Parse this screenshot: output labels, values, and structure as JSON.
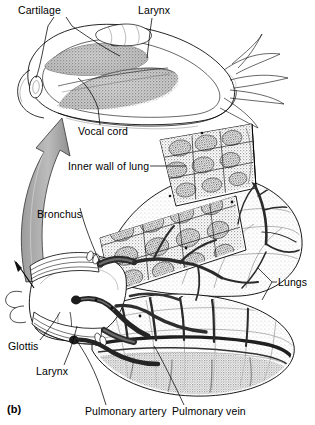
{
  "figure": {
    "panel_id": "(b)",
    "colors": {
      "ink": "#000000",
      "paper": "#ffffff",
      "arrow_fill": "#b0b0b0",
      "tissue_shade": "#8a8a8a",
      "vessel_dark": "#2b2b2b"
    }
  },
  "labels": [
    {
      "id": "cartilage",
      "text": "Cartilage",
      "x": 18,
      "y": 5,
      "leader_to": [
        [
          67,
          17
        ],
        [
          118,
          57
        ]
      ]
    },
    {
      "id": "cartilage-2",
      "text": "",
      "x": 0,
      "y": 0,
      "leader_to": [
        [
          53,
          17
        ],
        [
          36,
          93
        ]
      ]
    },
    {
      "id": "larynx-top",
      "text": "Larynx",
      "x": 138,
      "y": 5,
      "leader_to": [
        [
          150,
          17
        ],
        [
          146,
          60
        ]
      ]
    },
    {
      "id": "vocal-cord",
      "text": "Vocal cord",
      "x": 78,
      "y": 128,
      "leader_to": [
        [
          98,
          126
        ],
        [
          75,
          78
        ]
      ]
    },
    {
      "id": "inner-wall",
      "text": "Inner wall of lung",
      "x": 68,
      "y": 163,
      "leader_to": [
        [
          148,
          167
        ],
        [
          186,
          167
        ]
      ]
    },
    {
      "id": "bronchus",
      "text": "Bronchus",
      "x": 37,
      "y": 211,
      "leader_to": [
        [
          80,
          220
        ],
        [
          99,
          262
        ]
      ]
    },
    {
      "id": "lungs",
      "text": "Lungs",
      "x": 277,
      "y": 280,
      "leader_to": [
        [
          274,
          284
        ],
        [
          252,
          268
        ]
      ]
    },
    {
      "id": "glottis",
      "text": "Glottis",
      "x": 8,
      "y": 344,
      "leader_to": [
        [
          38,
          342
        ],
        [
          58,
          312
        ]
      ]
    },
    {
      "id": "larynx-bottom",
      "text": "Larynx",
      "x": 36,
      "y": 369,
      "leader_to": [
        [
          62,
          367
        ],
        [
          77,
          327
        ]
      ]
    },
    {
      "id": "pulmonary-artery",
      "text": "Pulmonary artery",
      "x": 85,
      "y": 409,
      "leader_to": [
        [
          105,
          406
        ],
        [
          74,
          340
        ]
      ]
    },
    {
      "id": "pulmonary-vein",
      "text": "Pulmonary vein",
      "x": 172,
      "y": 409,
      "leader_to": [
        [
          182,
          406
        ],
        [
          155,
          345
        ]
      ]
    }
  ],
  "structures": [
    {
      "name": "larynx-cutaway-enlargement",
      "description": "enlarged opened larynx showing paired stippled vocal cords, cartilage ring, muscle fibers"
    },
    {
      "name": "magnification-arrow",
      "description": "thick curved gray arrow from glottis up to enlarged larynx view"
    },
    {
      "name": "upper-lung",
      "description": "lung with cut-away flap exposing faveolar honeycomb inner wall"
    },
    {
      "name": "lower-lung",
      "description": "second lung showing surface vasculature and faveolae"
    },
    {
      "name": "trachea-glottis-complex",
      "description": "glottis, larynx and bronchus at left of lungs"
    },
    {
      "name": "pulmonary-vessels",
      "description": "dark branching pulmonary artery and vein over lung surfaces"
    }
  ]
}
